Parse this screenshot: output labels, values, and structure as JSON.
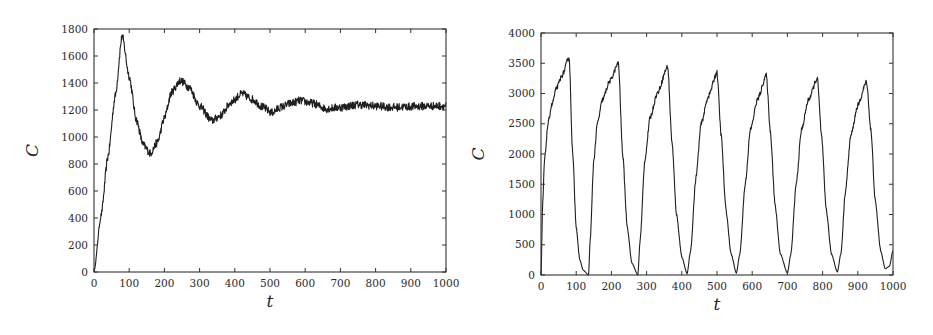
{
  "chart_data": [
    {
      "type": "line",
      "title": "",
      "xlabel": "t",
      "ylabel": "C",
      "xlim": [
        0,
        1000
      ],
      "ylim": [
        0,
        1800
      ],
      "xticks": [
        0,
        100,
        200,
        300,
        400,
        500,
        600,
        700,
        800,
        900,
        1000
      ],
      "yticks": [
        0,
        200,
        400,
        600,
        800,
        1000,
        1200,
        1400,
        1600,
        1800
      ],
      "grid": false,
      "legend": null,
      "noise": 30,
      "series": [
        {
          "name": "C(t)",
          "x": [
            0,
            20,
            40,
            60,
            80,
            100,
            120,
            140,
            160,
            180,
            200,
            220,
            245,
            270,
            300,
            335,
            360,
            390,
            420,
            450,
            480,
            505,
            530,
            560,
            585,
            620,
            660,
            700,
            750,
            800,
            850,
            900,
            950,
            1000
          ],
          "values": [
            0,
            420,
            860,
            1300,
            1750,
            1450,
            1130,
            940,
            880,
            960,
            1140,
            1330,
            1420,
            1370,
            1230,
            1120,
            1160,
            1260,
            1320,
            1280,
            1220,
            1180,
            1220,
            1250,
            1270,
            1250,
            1210,
            1220,
            1240,
            1230,
            1220,
            1225,
            1230,
            1230
          ]
        }
      ]
    },
    {
      "type": "line",
      "title": "",
      "xlabel": "t",
      "ylabel": "C",
      "xlim": [
        0,
        1000
      ],
      "ylim": [
        0,
        4000
      ],
      "xticks": [
        0,
        100,
        200,
        300,
        400,
        500,
        600,
        700,
        800,
        900,
        1000
      ],
      "yticks": [
        0,
        500,
        1000,
        1500,
        2000,
        2500,
        3000,
        3500,
        4000
      ],
      "grid": false,
      "legend": null,
      "noise": 40,
      "series": [
        {
          "name": "C(t)",
          "x": [
            0,
            5,
            10,
            20,
            30,
            45,
            60,
            80,
            90,
            100,
            110,
            120,
            135,
            140,
            150,
            160,
            175,
            195,
            220,
            232,
            245,
            258,
            275,
            282,
            295,
            310,
            330,
            360,
            372,
            385,
            400,
            415,
            425,
            440,
            455,
            475,
            500,
            512,
            525,
            540,
            555,
            565,
            580,
            595,
            615,
            640,
            652,
            665,
            680,
            700,
            710,
            725,
            740,
            760,
            785,
            797,
            810,
            825,
            842,
            852,
            865,
            880,
            900,
            925,
            937,
            950,
            965,
            978,
            990,
            1000
          ],
          "values": [
            0,
            1200,
            1900,
            2500,
            2800,
            3100,
            3300,
            3600,
            2000,
            800,
            250,
            80,
            0,
            600,
            1900,
            2500,
            2900,
            3200,
            3500,
            2000,
            800,
            200,
            0,
            600,
            1900,
            2600,
            3000,
            3450,
            2200,
            1000,
            300,
            20,
            400,
            1600,
            2500,
            2950,
            3350,
            2300,
            1100,
            350,
            30,
            350,
            1500,
            2400,
            2900,
            3300,
            2350,
            1150,
            350,
            30,
            350,
            1500,
            2400,
            2900,
            3250,
            2300,
            1100,
            350,
            50,
            350,
            1400,
            2300,
            2800,
            3200,
            2400,
            1200,
            400,
            100,
            150,
            400
          ]
        }
      ]
    }
  ]
}
